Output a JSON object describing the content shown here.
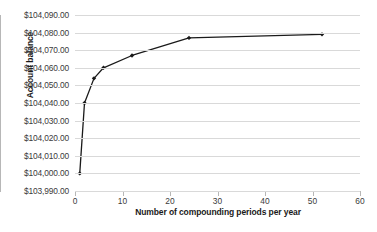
{
  "chart_data": {
    "type": "line",
    "title": "",
    "xlabel": "Number of compounding periods per year",
    "ylabel": "Account balance",
    "x": [
      1,
      2,
      4,
      6,
      12,
      24,
      52
    ],
    "values": [
      104000.0,
      104040.0,
      104054.0,
      104060.0,
      104067.0,
      104077.0,
      104079.0
    ],
    "series": [
      {
        "name": "Account balance",
        "x": [
          1,
          2,
          4,
          6,
          12,
          24,
          52
        ],
        "values": [
          104000.0,
          104040.0,
          104054.0,
          104060.0,
          104067.0,
          104077.0,
          104079.0
        ]
      }
    ],
    "xlim": [
      0,
      60
    ],
    "ylim": [
      103990,
      104090
    ],
    "xticks": [
      0,
      10,
      20,
      30,
      40,
      50,
      60
    ],
    "xtick_labels": [
      "0",
      "10",
      "20",
      "30",
      "40",
      "50",
      "60"
    ],
    "yticks": [
      103990,
      104000,
      104010,
      104020,
      104030,
      104040,
      104050,
      104060,
      104070,
      104080,
      104090
    ],
    "ytick_labels": [
      "$103,990.00",
      "$104,000.00",
      "$104,010.00",
      "$104,020.00",
      "$104,030.00",
      "$104,040.00",
      "$104,050.00",
      "$104,060.00",
      "$104,070.00",
      "$104,080.00",
      "$104,090.00"
    ],
    "grid": true,
    "grid_axis": "y",
    "legend": false,
    "legend_position": "none",
    "marker": "diamond",
    "line_color": "#1a1a1a",
    "marker_color": "#1a1a1a",
    "grid_color": "#d9d9d9",
    "axis_color": "#b7b7b7",
    "background_color": "#ffffff",
    "text_color": "#3b3b3b"
  }
}
